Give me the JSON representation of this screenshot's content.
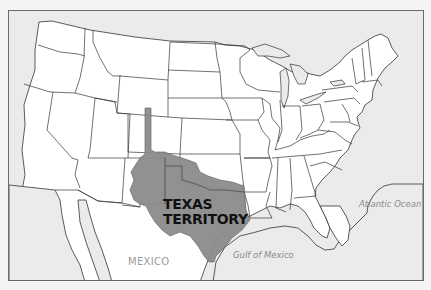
{
  "map": {
    "title": "Texas Territory map",
    "labels": {
      "territory_line1": "TEXAS",
      "territory_line2": "TERRITORY",
      "country": "MEXICO",
      "gulf": "Gulf of Mexico",
      "ocean": "Atlantic Ocean"
    },
    "colors": {
      "land": "#ffffff",
      "water": "#ebebeb",
      "territory": "#8c8c8c",
      "border": "#333333",
      "frame": "#6a6a6a"
    },
    "highlighted_region": "Texas Territory (Republic of Texas claimed area incl. strip into Colorado/Wyoming)"
  }
}
